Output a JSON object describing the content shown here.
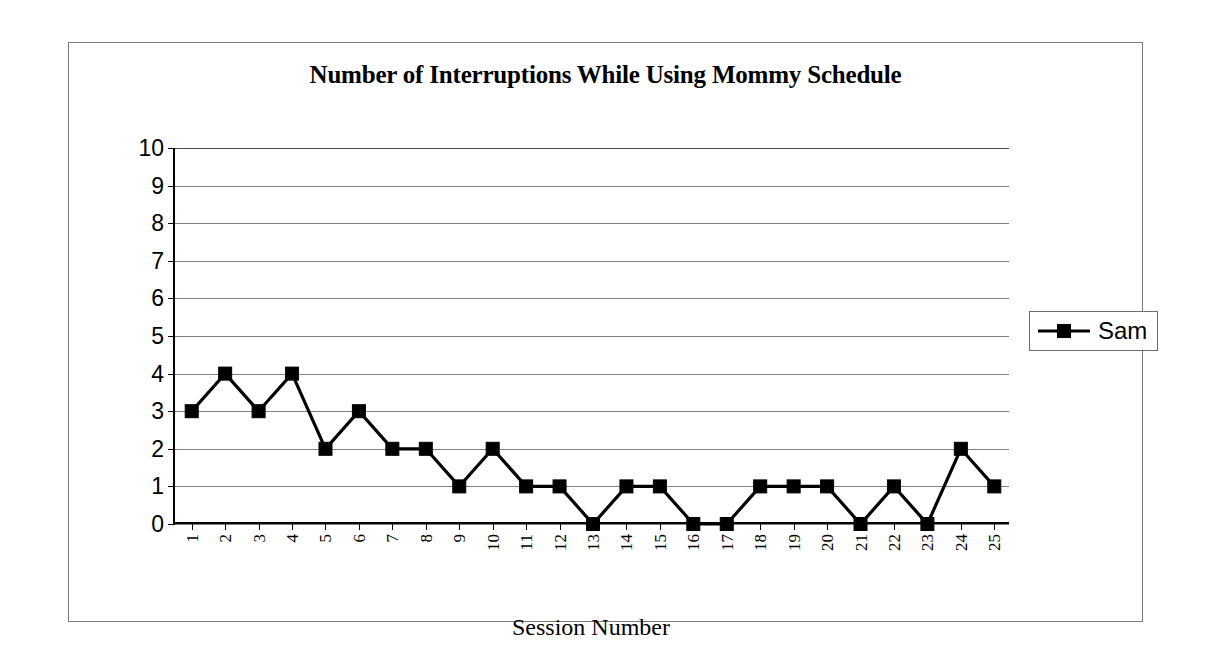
{
  "chart_data": {
    "type": "line",
    "title": "Number of Interruptions While Using Mommy Schedule",
    "xlabel": "Session Number",
    "ylabel": "",
    "categories": [
      "1",
      "2",
      "3",
      "4",
      "5",
      "6",
      "7",
      "8",
      "9",
      "10",
      "11",
      "12",
      "13",
      "14",
      "15",
      "16",
      "17",
      "18",
      "19",
      "20",
      "21",
      "22",
      "23",
      "24",
      "25"
    ],
    "series": [
      {
        "name": "Sam",
        "values": [
          3,
          4,
          3,
          4,
          2,
          3,
          2,
          2,
          1,
          2,
          1,
          1,
          0,
          1,
          1,
          0,
          0,
          1,
          1,
          1,
          0,
          1,
          0,
          2,
          1
        ],
        "color": "#000000",
        "marker": "square"
      }
    ],
    "ylim": [
      0,
      10
    ],
    "y_ticks": [
      "0",
      "1",
      "2",
      "3",
      "4",
      "5",
      "6",
      "7",
      "8",
      "9",
      "10"
    ],
    "grid": true,
    "legend_position": "right"
  },
  "legend": {
    "entries": [
      {
        "label": "Sam"
      }
    ]
  }
}
